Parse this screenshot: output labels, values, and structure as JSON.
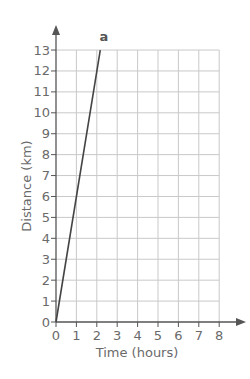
{
  "chart_data": {
    "type": "line",
    "title": "",
    "xlabel": "Time (hours)",
    "ylabel": "Distance (km)",
    "xlim": [
      0,
      8
    ],
    "ylim": [
      0,
      13
    ],
    "x_ticks": [
      0,
      1,
      2,
      3,
      4,
      5,
      6,
      7,
      8
    ],
    "y_ticks": [
      0,
      1,
      2,
      3,
      4,
      5,
      6,
      7,
      8,
      9,
      10,
      11,
      12,
      13
    ],
    "grid": true,
    "series": [
      {
        "name": "a",
        "x": [
          0,
          2.17
        ],
        "y": [
          0,
          13
        ],
        "slope": 6
      }
    ],
    "annotations": [
      {
        "text": "a",
        "x": 2.35,
        "y": 13.45
      }
    ]
  },
  "colors": {
    "grid": "#c9c9c9",
    "axis": "#555555",
    "line": "#444444",
    "text": "#6a6a6a"
  }
}
